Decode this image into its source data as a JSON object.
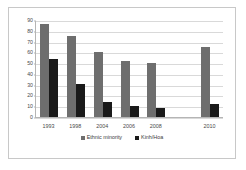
{
  "chart_data": {
    "type": "bar",
    "title": "",
    "xlabel": "",
    "ylabel": "",
    "ylim": [
      0,
      90
    ],
    "yticks": [
      0,
      10,
      20,
      30,
      40,
      50,
      60,
      70,
      80,
      90
    ],
    "grid": true,
    "legend_position": "bottom",
    "categories": [
      "1993",
      "1998",
      "2004",
      "2006",
      "2008",
      "",
      "2010"
    ],
    "series": [
      {
        "name": "Ethnic minority",
        "color": "#6e6e6e",
        "values": [
          86,
          75,
          60,
          52,
          50,
          null,
          65
        ]
      },
      {
        "name": "Kinh/Hoa",
        "color": "#1a1a1a",
        "values": [
          54,
          31,
          13.5,
          10,
          8.5,
          null,
          12
        ]
      }
    ]
  }
}
